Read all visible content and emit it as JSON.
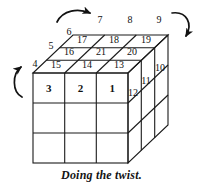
{
  "figure": {
    "title": "Doing the twist.",
    "caption": "Doing the twist.",
    "type": "cube-diagram",
    "line_color": "#1a1a1a",
    "text_color": "#111111",
    "background": "#ffffff"
  },
  "labels": {
    "front_row": [
      "3",
      "2",
      "1"
    ],
    "top_front_row": [
      "15",
      "14",
      "13"
    ],
    "top_middle_row": [
      "16",
      "21",
      "20"
    ],
    "top_back_row": [
      "17",
      "18",
      "19"
    ],
    "right_col": [
      "12",
      "11",
      "10"
    ],
    "outer_top_left": "6",
    "outer_top_mid": "7",
    "outer_top_right1": "8",
    "outer_top_right2": "9",
    "outer_left_upper": "5",
    "outer_left_lower": "4",
    "n1": "1",
    "n2": "2",
    "n3": "3",
    "n4": "4",
    "n5": "5",
    "n6": "6",
    "n7": "7",
    "n8": "8",
    "n9": "9",
    "n10": "10",
    "n11": "11",
    "n12": "12",
    "n13": "13",
    "n14": "14",
    "n15": "15",
    "n16": "16",
    "n17": "17",
    "n18": "18",
    "n19": "19",
    "n20": "20",
    "n21": "21"
  },
  "arrows": {
    "top": "curved-arrow-right",
    "left": "curved-arrow-up",
    "right": "curved-arrow-down"
  }
}
